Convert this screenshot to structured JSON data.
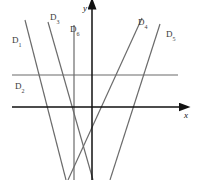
{
  "figure": {
    "background_color": "#ffffff",
    "axis_color": "#111111",
    "line_color": "#6b6b6b",
    "label_color": "#3a3a3a",
    "width": 199,
    "height": 180
  },
  "axes": {
    "x_axis": {
      "label": "x",
      "label_glyph": "x",
      "y_pixel": 107,
      "x_start": 12,
      "x_end": 180,
      "arrow": "right"
    },
    "y_axis": {
      "label": "y",
      "label_glyph": "y",
      "x_pixel": 92,
      "y_start": 180,
      "y_end": 8,
      "arrow": "up"
    }
  },
  "lines": [
    {
      "id": "D1",
      "label_base": "D",
      "label_sub": "1",
      "kind": "oblique",
      "slope_sign": "negative",
      "x1": 25,
      "y1": 20,
      "x2": 66,
      "y2": 180,
      "label_x": 12,
      "label_y": 43
    },
    {
      "id": "D2",
      "label_base": "D",
      "label_sub": "2",
      "kind": "horizontal",
      "slope_sign": "zero",
      "x1": 12,
      "y1": 75,
      "x2": 178,
      "y2": 75,
      "label_x": 15,
      "label_y": 89
    },
    {
      "id": "D3",
      "label_base": "D",
      "label_sub": "3",
      "kind": "oblique",
      "slope_sign": "negative",
      "x1": 48,
      "y1": 22,
      "x2": 93,
      "y2": 180,
      "label_x": 50,
      "label_y": 20
    },
    {
      "id": "D4",
      "label_base": "D",
      "label_sub": "4",
      "kind": "oblique",
      "slope_sign": "positive",
      "x1": 68,
      "y1": 180,
      "x2": 142,
      "y2": 18,
      "label_x": 138,
      "label_y": 25
    },
    {
      "id": "D5",
      "label_base": "D",
      "label_sub": "5",
      "kind": "oblique",
      "slope_sign": "negative",
      "x1": 160,
      "y1": 24,
      "x2": 110,
      "y2": 180,
      "label_x": 166,
      "label_y": 37
    },
    {
      "id": "D6",
      "label_base": "D",
      "label_sub": "6",
      "kind": "vertical",
      "slope_sign": "undefined",
      "x1": 74,
      "y1": 25,
      "x2": 74,
      "y2": 180,
      "label_x": 70,
      "label_y": 32
    }
  ]
}
